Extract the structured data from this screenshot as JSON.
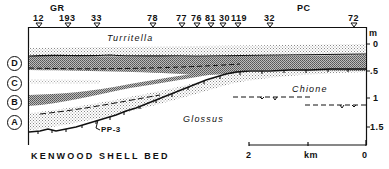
{
  "figure": {
    "title": "KENWOOD SHELL BED",
    "section_labels": [
      "GR",
      "PC"
    ],
    "stations": [
      {
        "id": "12",
        "x": 39
      },
      {
        "id": "193",
        "x": 68
      },
      {
        "id": "33",
        "x": 97
      },
      {
        "id": "78",
        "x": 153
      },
      {
        "id": "77",
        "x": 182
      },
      {
        "id": "76",
        "x": 197
      },
      {
        "id": "81",
        "x": 211
      },
      {
        "id": "30",
        "x": 223
      },
      {
        "id": "119",
        "x": 238
      },
      {
        "id": "32",
        "x": 270
      },
      {
        "id": "72",
        "x": 354
      }
    ],
    "units": [
      {
        "label": "D",
        "y": 62
      },
      {
        "label": "C",
        "y": 82
      },
      {
        "label": "B",
        "y": 101
      },
      {
        "label": "A",
        "y": 121
      }
    ],
    "taxa": [
      {
        "name": "Turritella",
        "x": 107,
        "y": 30
      },
      {
        "name": "Chione",
        "x": 292,
        "y": 86
      },
      {
        "name": "Glossus",
        "x": 182,
        "y": 114
      }
    ],
    "annotation": "PP-3",
    "depth_axis": {
      "unit": "m",
      "ticks": [
        {
          "label": "0",
          "y": 44
        },
        {
          "label": ".5",
          "y": 71
        },
        {
          "label": "1",
          "y": 98
        },
        {
          "label": "1.5",
          "y": 127
        }
      ]
    },
    "distance_axis": {
      "unit": "km",
      "ticks": [
        {
          "label": "2",
          "x": 249
        },
        {
          "label": "0",
          "x": 366
        }
      ]
    },
    "colors": {
      "ink": "#111111",
      "stipple_light": "#c8c8c8",
      "stipple_dark": "#8a8a8a",
      "background": "#ffffff"
    }
  }
}
